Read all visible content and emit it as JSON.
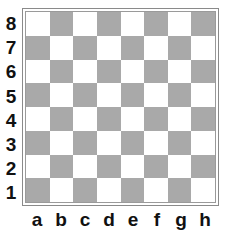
{
  "board": {
    "files": [
      "a",
      "b",
      "c",
      "d",
      "e",
      "f",
      "g",
      "h"
    ],
    "ranks": [
      "8",
      "7",
      "6",
      "5",
      "4",
      "3",
      "2",
      "1"
    ],
    "colors": {
      "light": "#ffffff",
      "dark": "#a9a9a9",
      "border": "#8a8a8a"
    },
    "pieces": []
  }
}
